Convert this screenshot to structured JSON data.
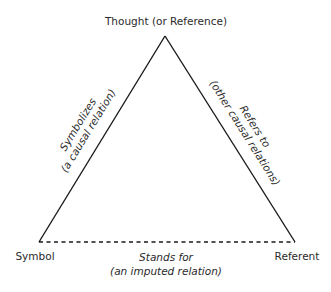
{
  "diagram": {
    "nodes": {
      "top": "Thought (or Reference)",
      "left": "Symbol",
      "right": "Referent"
    },
    "edges": {
      "left": {
        "line1": "Symbolizes",
        "line2": "(a causal relation)",
        "style": "solid"
      },
      "right": {
        "line1": "Refers to",
        "line2": "(other causal relations)",
        "style": "solid"
      },
      "bottom": {
        "line1": "Stands for",
        "line2": "(an imputed relation)",
        "style": "dashed"
      }
    },
    "line_color": "#1a1a1a"
  }
}
